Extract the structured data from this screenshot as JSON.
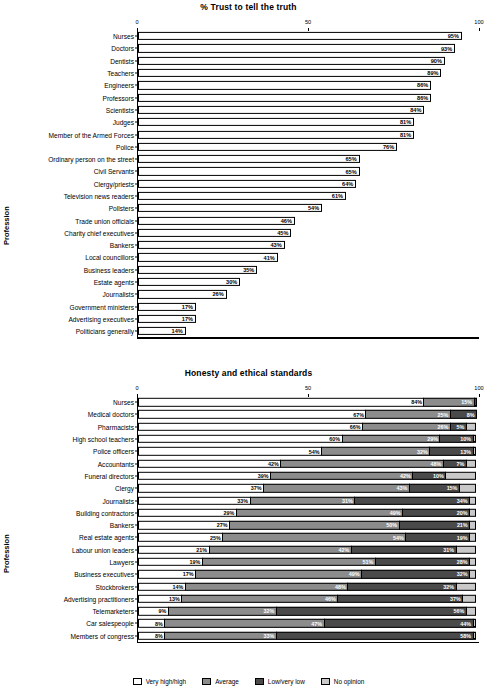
{
  "chart_data": [
    {
      "id": "trust",
      "type": "bar",
      "title": "% Trust to tell the truth",
      "xlabel": "",
      "ylabel": "Profession",
      "xlim": [
        0,
        100
      ],
      "ticks": [
        "0",
        "50",
        "100"
      ],
      "orientation": "horizontal",
      "grid": false,
      "legend": "none",
      "categories": [
        "Nurses",
        "Doctors",
        "Dentists",
        "Teachers",
        "Engineers",
        "Professors",
        "Scientists",
        "Judges",
        "Member of the Armed Forces",
        "Police",
        "Ordinary person on the street",
        "Civil Servants",
        "Clergy/priests",
        "Television news readers",
        "Pollsters",
        "Trade union officials",
        "Charity chief executives",
        "Bankers",
        "Local councillors",
        "Business leaders",
        "Estate agents",
        "Journalists",
        "Government ministers",
        "Advertising executives",
        "Politicians generally"
      ],
      "values": [
        95,
        93,
        90,
        89,
        86,
        86,
        84,
        81,
        81,
        76,
        65,
        65,
        64,
        61,
        54,
        46,
        45,
        43,
        41,
        35,
        30,
        26,
        17,
        17,
        14
      ],
      "labels": [
        "95%",
        "93%",
        "90%",
        "89%",
        "86%",
        "86%",
        "84%",
        "81%",
        "81%",
        "76%",
        "65%",
        "65%",
        "64%",
        "61%",
        "54%",
        "46%",
        "45%",
        "43%",
        "41%",
        "35%",
        "30%",
        "26%",
        "17%",
        "17%",
        "14%"
      ]
    },
    {
      "id": "honesty",
      "type": "bar",
      "stacked": true,
      "title": "Honesty and ethical standards",
      "xlabel": "",
      "ylabel": "Profession",
      "xlim": [
        0,
        100
      ],
      "ticks": [
        "0",
        "50",
        "100"
      ],
      "orientation": "horizontal",
      "grid": false,
      "legend_position": "bottom",
      "series_names": [
        "Very high/high",
        "Average",
        "Low/very low",
        "No opinion"
      ],
      "series_colors": [
        "#ffffff",
        "#8c8c8c",
        "#4a4a4a",
        "#c9c9c9"
      ],
      "categories": [
        "Nurses",
        "Medical doctors",
        "Pharmacists",
        "High school teachers",
        "Police officers",
        "Accountants",
        "Funeral directors",
        "Clergy",
        "Journalists",
        "Building contractors",
        "Bankers",
        "Real estate agents",
        "Labour union leaders",
        "Lawyers",
        "Business executives",
        "Stockbrokers",
        "Advertising practitioners",
        "Telemarketers",
        "Car salespeople",
        "Members of congress"
      ],
      "rows": [
        {
          "values": [
            84,
            15,
            1,
            0
          ],
          "labels": [
            "84%",
            "15%",
            "",
            ""
          ]
        },
        {
          "values": [
            67,
            25,
            8,
            0
          ],
          "labels": [
            "67%",
            "25%",
            "8%",
            ""
          ]
        },
        {
          "values": [
            66,
            26,
            5,
            3
          ],
          "labels": [
            "66%",
            "26%",
            "5%",
            ""
          ]
        },
        {
          "values": [
            60,
            29,
            10,
            1
          ],
          "labels": [
            "60%",
            "29%",
            "10%",
            ""
          ]
        },
        {
          "values": [
            54,
            32,
            13,
            1
          ],
          "labels": [
            "54%",
            "32%",
            "13%",
            ""
          ]
        },
        {
          "values": [
            42,
            48,
            7,
            3
          ],
          "labels": [
            "42%",
            "48%",
            "7%",
            ""
          ]
        },
        {
          "values": [
            39,
            42,
            10,
            9
          ],
          "labels": [
            "39%",
            "42%",
            "10%",
            ""
          ]
        },
        {
          "values": [
            37,
            43,
            15,
            5
          ],
          "labels": [
            "37%",
            "43%",
            "15%",
            ""
          ]
        },
        {
          "values": [
            33,
            31,
            34,
            2
          ],
          "labels": [
            "33%",
            "31%",
            "34%",
            ""
          ]
        },
        {
          "values": [
            29,
            49,
            20,
            2
          ],
          "labels": [
            "29%",
            "49%",
            "20%",
            ""
          ]
        },
        {
          "values": [
            27,
            50,
            21,
            2
          ],
          "labels": [
            "27%",
            "50%",
            "21%",
            ""
          ]
        },
        {
          "values": [
            25,
            54,
            19,
            2
          ],
          "labels": [
            "25%",
            "54%",
            "19%",
            ""
          ]
        },
        {
          "values": [
            21,
            42,
            31,
            6
          ],
          "labels": [
            "21%",
            "42%",
            "31%",
            ""
          ]
        },
        {
          "values": [
            19,
            51,
            28,
            2
          ],
          "labels": [
            "19%",
            "51%",
            "28%",
            ""
          ]
        },
        {
          "values": [
            17,
            49,
            32,
            2
          ],
          "labels": [
            "17%",
            "49%",
            "32%",
            ""
          ]
        },
        {
          "values": [
            14,
            48,
            32,
            6
          ],
          "labels": [
            "14%",
            "48%",
            "32%",
            ""
          ]
        },
        {
          "values": [
            13,
            46,
            37,
            4
          ],
          "labels": [
            "13%",
            "46%",
            "37%",
            ""
          ]
        },
        {
          "values": [
            9,
            32,
            56,
            3
          ],
          "labels": [
            "9%",
            "32%",
            "56%",
            ""
          ]
        },
        {
          "values": [
            8,
            47,
            44,
            1
          ],
          "labels": [
            "8%",
            "47%",
            "44%",
            ""
          ]
        },
        {
          "values": [
            8,
            33,
            58,
            1
          ],
          "labels": [
            "8%",
            "33%",
            "58%",
            ""
          ]
        }
      ]
    }
  ],
  "legend": {
    "items": [
      {
        "label": "Very high/high",
        "color": "#ffffff"
      },
      {
        "label": "Average",
        "color": "#8c8c8c"
      },
      {
        "label": "Low/very low",
        "color": "#4a4a4a"
      },
      {
        "label": "No opinion",
        "color": "#c9c9c9"
      }
    ]
  }
}
